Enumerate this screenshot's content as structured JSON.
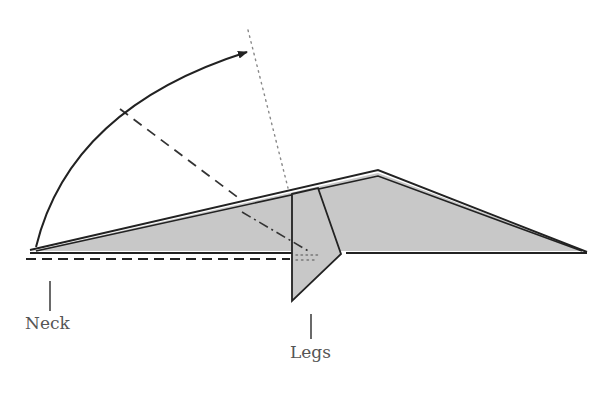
{
  "diagram": {
    "type": "fold-diagram",
    "labels": {
      "neck": "Neck",
      "legs": "Legs"
    },
    "colors": {
      "fill": "#c8c8c8",
      "stroke": "#222222",
      "label": "#555555",
      "dotted": "#888888"
    }
  }
}
